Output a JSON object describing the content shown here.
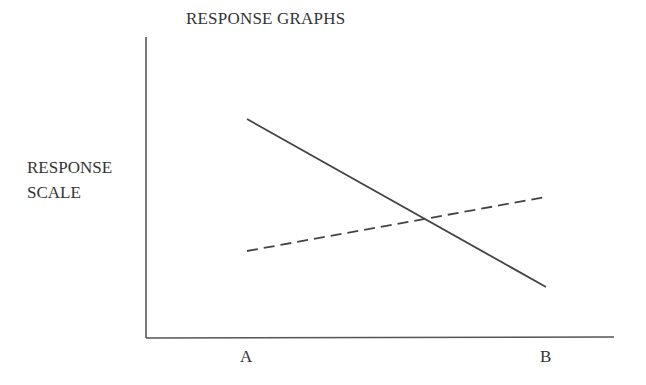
{
  "chart_data": {
    "type": "line",
    "title": "RESPONSE GRAPHS",
    "xlabel": "",
    "ylabel": "RESPONSE SCALE",
    "ylabel_lines": [
      "RESPONSE",
      "SCALE"
    ],
    "categories": [
      "A",
      "B"
    ],
    "series": [
      {
        "name": "solid",
        "style": "solid",
        "values": [
          7.3,
          1.7
        ]
      },
      {
        "name": "dashed",
        "style": "dashed",
        "values": [
          2.9,
          4.7
        ]
      }
    ],
    "ylim": [
      0,
      10
    ],
    "grid": false,
    "legend": null,
    "colors": {
      "line": "#444444",
      "axis": "#555555",
      "text": "#333333"
    }
  }
}
